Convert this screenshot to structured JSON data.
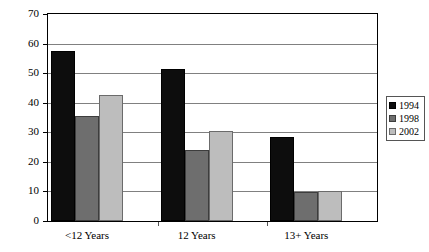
{
  "chart_data": {
    "type": "bar",
    "title": "",
    "xlabel": "",
    "ylabel": "",
    "categories": [
      "<12 Years",
      "12 Years",
      "13+ Years"
    ],
    "series": [
      {
        "name": "1994",
        "color": "#0d0d0d",
        "values": [
          57.5,
          51.5,
          28.5
        ]
      },
      {
        "name": "1998",
        "color": "#6e6e6e",
        "values": [
          35.5,
          24.0,
          9.8
        ]
      },
      {
        "name": "2002",
        "color": "#bdbdbd",
        "values": [
          42.5,
          30.5,
          10.3
        ]
      }
    ],
    "ylim": [
      0,
      70
    ],
    "ytick_values": [
      0,
      10,
      20,
      30,
      40,
      50,
      60,
      70
    ],
    "ytick_labels": [
      "0",
      "10",
      "20",
      "30",
      "40",
      "50",
      "60",
      "70"
    ],
    "grid": "horizontal",
    "legend_position": "right-outside",
    "legend_entries": [
      "1994",
      "1998",
      "2002"
    ]
  }
}
